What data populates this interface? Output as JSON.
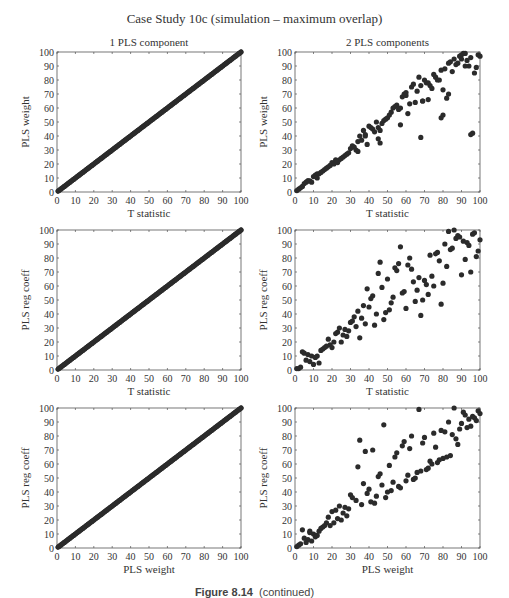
{
  "figure": {
    "title": "Case Study 10c (simulation – maximum overlap)",
    "caption_label": "Figure 8.14",
    "caption_text": "(continued)",
    "column_titles": [
      "1 PLS component",
      "2 PLS components"
    ],
    "marker_color": "#2b2b2b",
    "axis_color": "#555555"
  },
  "chart_data": [
    {
      "type": "scatter",
      "panel": "row1-col1",
      "title": "1 PLS component",
      "xlabel": "T statistic",
      "ylabel": "PLS weight",
      "xlim": [
        0,
        100
      ],
      "ylim": [
        0,
        100
      ],
      "xticks": [
        0,
        10,
        20,
        30,
        40,
        50,
        60,
        70,
        80,
        90,
        100
      ],
      "yticks": [
        0,
        10,
        20,
        30,
        40,
        50,
        60,
        70,
        80,
        90,
        100
      ],
      "grid": false,
      "pattern": "identity",
      "x": [
        1,
        2,
        3,
        4,
        5,
        6,
        7,
        8,
        9,
        10,
        11,
        12,
        13,
        14,
        15,
        16,
        17,
        18,
        19,
        20,
        21,
        22,
        23,
        24,
        25,
        26,
        27,
        28,
        29,
        30,
        31,
        32,
        33,
        34,
        35,
        36,
        37,
        38,
        39,
        40,
        41,
        42,
        43,
        44,
        45,
        46,
        47,
        48,
        49,
        50,
        51,
        52,
        53,
        54,
        55,
        56,
        57,
        58,
        59,
        60,
        61,
        62,
        63,
        64,
        65,
        66,
        67,
        68,
        69,
        70,
        71,
        72,
        73,
        74,
        75,
        76,
        77,
        78,
        79,
        80,
        81,
        82,
        83,
        84,
        85,
        86,
        87,
        88,
        89,
        90,
        91,
        92,
        93,
        94,
        95,
        96,
        97,
        98,
        99,
        100
      ],
      "y": [
        1,
        2,
        3,
        4,
        5,
        6,
        7,
        8,
        9,
        10,
        11,
        12,
        13,
        14,
        15,
        16,
        17,
        18,
        19,
        20,
        21,
        22,
        23,
        24,
        25,
        26,
        27,
        28,
        29,
        30,
        31,
        32,
        33,
        34,
        35,
        36,
        37,
        38,
        39,
        40,
        41,
        42,
        43,
        44,
        45,
        46,
        47,
        48,
        49,
        50,
        51,
        52,
        53,
        54,
        55,
        56,
        57,
        58,
        59,
        60,
        61,
        62,
        63,
        64,
        65,
        66,
        67,
        68,
        69,
        70,
        71,
        72,
        73,
        74,
        75,
        76,
        77,
        78,
        79,
        80,
        81,
        82,
        83,
        84,
        85,
        86,
        87,
        88,
        89,
        90,
        91,
        92,
        93,
        94,
        95,
        96,
        97,
        98,
        99,
        100
      ]
    },
    {
      "type": "scatter",
      "panel": "row1-col2",
      "title": "2 PLS components",
      "xlabel": "T statistic",
      "ylabel": "PLS weight",
      "xlim": [
        0,
        100
      ],
      "ylim": [
        0,
        100
      ],
      "xticks": [
        0,
        10,
        20,
        30,
        40,
        50,
        60,
        70,
        80,
        90,
        100
      ],
      "yticks": [
        0,
        10,
        20,
        30,
        40,
        50,
        60,
        70,
        80,
        90,
        100
      ],
      "grid": false,
      "x": [
        1,
        2,
        3,
        4,
        5,
        6,
        7,
        8,
        9,
        10,
        11,
        12,
        13,
        14,
        15,
        16,
        17,
        18,
        19,
        20,
        21,
        22,
        23,
        24,
        25,
        26,
        27,
        28,
        29,
        30,
        31,
        32,
        33,
        34,
        35,
        36,
        37,
        38,
        39,
        40,
        41,
        42,
        43,
        44,
        45,
        46,
        47,
        48,
        49,
        50,
        51,
        52,
        53,
        54,
        55,
        56,
        57,
        58,
        59,
        60,
        61,
        62,
        63,
        64,
        65,
        66,
        67,
        68,
        69,
        70,
        71,
        72,
        73,
        74,
        75,
        76,
        77,
        78,
        79,
        80,
        81,
        82,
        83,
        84,
        85,
        86,
        87,
        88,
        89,
        90,
        91,
        92,
        93,
        94,
        95,
        96,
        97,
        98,
        99,
        100,
        7,
        12,
        22,
        34,
        38,
        45,
        46,
        57,
        60,
        68,
        69,
        72,
        79,
        80,
        83,
        90,
        92,
        95
      ],
      "y": [
        1,
        2,
        3,
        4,
        6,
        7,
        8,
        8,
        7,
        11,
        12,
        13,
        13,
        14,
        15,
        16,
        17,
        18,
        19,
        21,
        20,
        22,
        21,
        23,
        24,
        25,
        26,
        27,
        28,
        31,
        33,
        32,
        30,
        36,
        40,
        37,
        44,
        41,
        34,
        47,
        46,
        45,
        43,
        50,
        38,
        35,
        49,
        51,
        52,
        53,
        55,
        57,
        60,
        61,
        62,
        59,
        48,
        68,
        70,
        69,
        56,
        63,
        75,
        77,
        64,
        72,
        82,
        39,
        65,
        80,
        78,
        66,
        76,
        74,
        84,
        82,
        80,
        80,
        87,
        73,
        88,
        67,
        92,
        93,
        86,
        95,
        91,
        92,
        97,
        98,
        99,
        99,
        94,
        90,
        96,
        42,
        85,
        89,
        98,
        97,
        8,
        10,
        23,
        29,
        40,
        46,
        44,
        60,
        71,
        76,
        65,
        78,
        53,
        55,
        70,
        95,
        90,
        41
      ]
    },
    {
      "type": "scatter",
      "panel": "row2-col1",
      "xlabel": "T statistic",
      "ylabel": "PLS reg coeff",
      "xlim": [
        0,
        100
      ],
      "ylim": [
        0,
        100
      ],
      "xticks": [
        0,
        10,
        20,
        30,
        40,
        50,
        60,
        70,
        80,
        90,
        100
      ],
      "yticks": [
        0,
        10,
        20,
        30,
        40,
        50,
        60,
        70,
        80,
        90,
        100
      ],
      "grid": false,
      "pattern": "identity",
      "x": [
        1,
        2,
        3,
        4,
        5,
        6,
        7,
        8,
        9,
        10,
        11,
        12,
        13,
        14,
        15,
        16,
        17,
        18,
        19,
        20,
        21,
        22,
        23,
        24,
        25,
        26,
        27,
        28,
        29,
        30,
        31,
        32,
        33,
        34,
        35,
        36,
        37,
        38,
        39,
        40,
        41,
        42,
        43,
        44,
        45,
        46,
        47,
        48,
        49,
        50,
        51,
        52,
        53,
        54,
        55,
        56,
        57,
        58,
        59,
        60,
        61,
        62,
        63,
        64,
        65,
        66,
        67,
        68,
        69,
        70,
        71,
        72,
        73,
        74,
        75,
        76,
        77,
        78,
        79,
        80,
        81,
        82,
        83,
        84,
        85,
        86,
        87,
        88,
        89,
        90,
        91,
        92,
        93,
        94,
        95,
        96,
        97,
        98,
        99,
        100
      ],
      "y": [
        1,
        2,
        3,
        4,
        5,
        6,
        7,
        8,
        9,
        10,
        11,
        12,
        13,
        14,
        15,
        16,
        17,
        18,
        19,
        20,
        21,
        22,
        23,
        24,
        25,
        26,
        27,
        28,
        29,
        30,
        31,
        32,
        33,
        34,
        35,
        36,
        37,
        38,
        39,
        40,
        41,
        42,
        43,
        44,
        45,
        46,
        47,
        48,
        49,
        50,
        51,
        52,
        53,
        54,
        55,
        56,
        57,
        58,
        59,
        60,
        61,
        62,
        63,
        64,
        65,
        66,
        67,
        68,
        69,
        70,
        71,
        72,
        73,
        74,
        75,
        76,
        77,
        78,
        79,
        80,
        81,
        82,
        83,
        84,
        85,
        86,
        87,
        88,
        89,
        90,
        91,
        92,
        93,
        94,
        95,
        96,
        97,
        98,
        99,
        100
      ]
    },
    {
      "type": "scatter",
      "panel": "row2-col2",
      "xlabel": "T statistic",
      "ylabel": "PLS reg coeff",
      "xlim": [
        0,
        100
      ],
      "ylim": [
        0,
        100
      ],
      "xticks": [
        0,
        10,
        20,
        30,
        40,
        50,
        60,
        70,
        80,
        90,
        100
      ],
      "yticks": [
        0,
        10,
        20,
        30,
        40,
        50,
        60,
        70,
        80,
        90,
        100
      ],
      "grid": false,
      "x": [
        1,
        2,
        3,
        4,
        5,
        6,
        7,
        8,
        9,
        10,
        11,
        12,
        13,
        14,
        15,
        16,
        17,
        18,
        19,
        20,
        21,
        22,
        23,
        24,
        25,
        26,
        27,
        28,
        29,
        30,
        31,
        32,
        33,
        34,
        35,
        36,
        37,
        38,
        39,
        40,
        41,
        42,
        43,
        44,
        45,
        46,
        47,
        48,
        49,
        50,
        51,
        52,
        53,
        54,
        55,
        56,
        57,
        58,
        59,
        60,
        61,
        62,
        63,
        64,
        65,
        66,
        67,
        68,
        69,
        70,
        71,
        72,
        73,
        74,
        75,
        76,
        77,
        78,
        79,
        80,
        81,
        82,
        83,
        84,
        85,
        86,
        87,
        88,
        89,
        90,
        91,
        92,
        93,
        94,
        95,
        96,
        97,
        98,
        99,
        100
      ],
      "y": [
        1,
        1,
        2,
        13,
        12,
        7,
        11,
        6,
        10,
        4,
        9,
        10,
        5,
        14,
        15,
        16,
        17,
        22,
        18,
        16,
        20,
        26,
        27,
        30,
        20,
        25,
        29,
        24,
        28,
        34,
        35,
        38,
        31,
        42,
        23,
        37,
        46,
        33,
        58,
        45,
        51,
        53,
        32,
        40,
        69,
        77,
        59,
        36,
        41,
        65,
        43,
        48,
        52,
        73,
        71,
        76,
        88,
        55,
        56,
        44,
        75,
        80,
        72,
        63,
        49,
        57,
        66,
        39,
        50,
        64,
        61,
        54,
        82,
        67,
        60,
        83,
        84,
        78,
        47,
        62,
        90,
        74,
        99,
        86,
        87,
        100,
        94,
        96,
        95,
        68,
        92,
        79,
        91,
        89,
        70,
        97,
        98,
        81,
        85,
        93
      ]
    },
    {
      "type": "scatter",
      "panel": "row3-col1",
      "xlabel": "PLS weight",
      "ylabel": "PLS reg coeff",
      "xlim": [
        0,
        100
      ],
      "ylim": [
        0,
        100
      ],
      "xticks": [
        0,
        10,
        20,
        30,
        40,
        50,
        60,
        70,
        80,
        90,
        100
      ],
      "yticks": [
        0,
        10,
        20,
        30,
        40,
        50,
        60,
        70,
        80,
        90,
        100
      ],
      "grid": false,
      "pattern": "identity",
      "x": [
        1,
        2,
        3,
        4,
        5,
        6,
        7,
        8,
        9,
        10,
        11,
        12,
        13,
        14,
        15,
        16,
        17,
        18,
        19,
        20,
        21,
        22,
        23,
        24,
        25,
        26,
        27,
        28,
        29,
        30,
        31,
        32,
        33,
        34,
        35,
        36,
        37,
        38,
        39,
        40,
        41,
        42,
        43,
        44,
        45,
        46,
        47,
        48,
        49,
        50,
        51,
        52,
        53,
        54,
        55,
        56,
        57,
        58,
        59,
        60,
        61,
        62,
        63,
        64,
        65,
        66,
        67,
        68,
        69,
        70,
        71,
        72,
        73,
        74,
        75,
        76,
        77,
        78,
        79,
        80,
        81,
        82,
        83,
        84,
        85,
        86,
        87,
        88,
        89,
        90,
        91,
        92,
        93,
        94,
        95,
        96,
        97,
        98,
        99,
        100
      ],
      "y": [
        1,
        2,
        3,
        4,
        5,
        6,
        7,
        8,
        9,
        10,
        11,
        12,
        13,
        14,
        15,
        16,
        17,
        18,
        19,
        20,
        21,
        22,
        23,
        24,
        25,
        26,
        27,
        28,
        29,
        30,
        31,
        32,
        33,
        34,
        35,
        36,
        37,
        38,
        39,
        40,
        41,
        42,
        43,
        44,
        45,
        46,
        47,
        48,
        49,
        50,
        51,
        52,
        53,
        54,
        55,
        56,
        57,
        58,
        59,
        60,
        61,
        62,
        63,
        64,
        65,
        66,
        67,
        68,
        69,
        70,
        71,
        72,
        73,
        74,
        75,
        76,
        77,
        78,
        79,
        80,
        81,
        82,
        83,
        84,
        85,
        86,
        87,
        88,
        89,
        90,
        91,
        92,
        93,
        94,
        95,
        96,
        97,
        98,
        99,
        100
      ]
    },
    {
      "type": "scatter",
      "panel": "row3-col2",
      "xlabel": "PLS weight",
      "ylabel": "PLS reg coeff",
      "xlim": [
        0,
        100
      ],
      "ylim": [
        0,
        100
      ],
      "xticks": [
        0,
        10,
        20,
        30,
        40,
        50,
        60,
        70,
        80,
        90,
        100
      ],
      "yticks": [
        0,
        10,
        20,
        30,
        40,
        50,
        60,
        70,
        80,
        90,
        100
      ],
      "grid": false,
      "x": [
        1,
        2,
        3,
        4,
        5,
        6,
        7,
        8,
        8,
        9,
        10,
        11,
        12,
        13,
        14,
        15,
        16,
        17,
        18,
        19,
        20,
        21,
        22,
        23,
        24,
        25,
        26,
        27,
        28,
        29,
        30,
        31,
        33,
        34,
        35,
        36,
        37,
        38,
        39,
        40,
        41,
        42,
        43,
        44,
        45,
        46,
        47,
        48,
        49,
        50,
        51,
        52,
        53,
        54,
        55,
        56,
        57,
        58,
        59,
        60,
        61,
        62,
        63,
        64,
        65,
        66,
        67,
        68,
        69,
        70,
        71,
        72,
        73,
        74,
        75,
        76,
        77,
        78,
        79,
        80,
        81,
        82,
        83,
        84,
        85,
        86,
        87,
        88,
        89,
        90,
        91,
        92,
        93,
        94,
        95,
        96,
        97,
        98,
        99,
        100
      ],
      "y": [
        1,
        2,
        3,
        13,
        7,
        4,
        6,
        12,
        11,
        5,
        10,
        8,
        9,
        12,
        14,
        15,
        16,
        18,
        22,
        16,
        26,
        18,
        27,
        21,
        30,
        20,
        25,
        29,
        23,
        28,
        38,
        36,
        34,
        58,
        77,
        31,
        46,
        69,
        39,
        42,
        33,
        70,
        32,
        37,
        51,
        53,
        45,
        88,
        36,
        40,
        59,
        41,
        47,
        65,
        68,
        44,
        43,
        73,
        76,
        48,
        52,
        71,
        80,
        49,
        50,
        54,
        99,
        55,
        75,
        79,
        56,
        57,
        62,
        60,
        82,
        72,
        61,
        63,
        84,
        64,
        83,
        65,
        90,
        66,
        81,
        100,
        78,
        74,
        85,
        89,
        97,
        95,
        86,
        92,
        87,
        94,
        93,
        91,
        98,
        96
      ]
    }
  ]
}
